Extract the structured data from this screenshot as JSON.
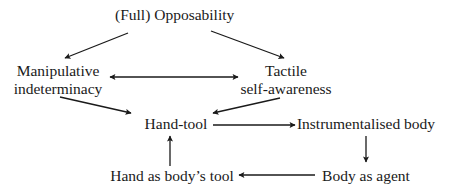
{
  "diagram": {
    "nodes": {
      "opposability": {
        "label": "(Full) Opposability"
      },
      "manipulative": {
        "line1": "Manipulative",
        "line2": "indeterminacy"
      },
      "tactile": {
        "line1": "Tactile",
        "line2": "self-awareness"
      },
      "hand_tool": {
        "label": "Hand-tool"
      },
      "instrumentalised": {
        "label": "Instrumentalised body"
      },
      "body_agent": {
        "label": "Body as agent"
      },
      "hand_body_tool": {
        "label": "Hand as body’s tool"
      }
    },
    "edges": [
      {
        "from": "(Full) Opposability",
        "to": "Manipulative indeterminacy",
        "type": "directed"
      },
      {
        "from": "(Full) Opposability",
        "to": "Tactile self-awareness",
        "type": "directed"
      },
      {
        "from": "Manipulative indeterminacy",
        "to": "Tactile self-awareness",
        "type": "bidirectional"
      },
      {
        "from": "Manipulative indeterminacy",
        "to": "Hand-tool",
        "type": "directed"
      },
      {
        "from": "Tactile self-awareness",
        "to": "Hand-tool",
        "type": "directed"
      },
      {
        "from": "Hand-tool",
        "to": "Instrumentalised body",
        "type": "directed"
      },
      {
        "from": "Instrumentalised body",
        "to": "Body as agent",
        "type": "directed"
      },
      {
        "from": "Body as agent",
        "to": "Hand as body’s tool",
        "type": "directed"
      },
      {
        "from": "Hand as body’s tool",
        "to": "Hand-tool",
        "type": "directed"
      }
    ],
    "colors": {
      "text": "#1a1a1a",
      "line": "#1a1a1a",
      "background": "#ffffff"
    }
  }
}
